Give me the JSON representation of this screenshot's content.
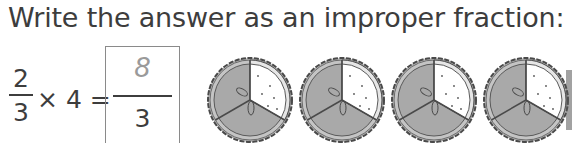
{
  "instruction": "Write the answer as an improper fraction:",
  "equation": {
    "fraction": {
      "numerator": "2",
      "denominator": "3"
    },
    "operator": "× 4 =",
    "multiplier": "4"
  },
  "answer": {
    "numerator": "8",
    "denominator": "3",
    "numerator_style": "handwritten-grey"
  },
  "illustration": {
    "description": "pies each divided into thirds, two thirds shaded",
    "pie_count_visible": 4,
    "slices_per_pie": 3,
    "shaded_slices_per_pie": 2,
    "colors": {
      "shaded": "#a9a9a9",
      "unshaded": "#ffffff",
      "crust": "#8c8c8c",
      "outline": "#4a4a4a"
    }
  }
}
